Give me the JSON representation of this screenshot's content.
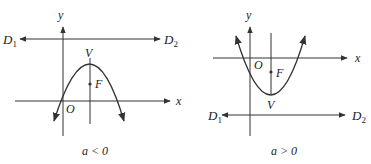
{
  "figures": [
    {
      "id": "left",
      "caption": "a < 0",
      "labels": {
        "y_axis": "y",
        "x_axis": "x",
        "origin": "O",
        "vertex": "V",
        "focus": "F",
        "directrix_left": "D",
        "directrix_left_sub": "1",
        "directrix_right": "D",
        "directrix_right_sub": "2"
      },
      "description": "Downward-opening parabola with vertex V above focus F; directrix D1D2 lies above the vertex"
    },
    {
      "id": "right",
      "caption": "a > 0",
      "labels": {
        "y_axis": "y",
        "x_axis": "x",
        "origin": "O",
        "vertex": "V",
        "focus": "F",
        "directrix_left": "D",
        "directrix_left_sub": "1",
        "directrix_right": "D",
        "directrix_right_sub": "2"
      },
      "description": "Upward-opening parabola with vertex V below focus F; directrix D1D2 lies below the vertex"
    }
  ],
  "colors": {
    "ink": "#333333",
    "background": "#ffffff"
  }
}
